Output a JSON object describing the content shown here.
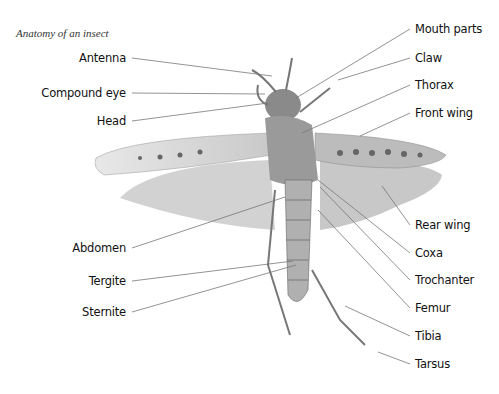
{
  "title": "Anatomy of an insect",
  "labels_left": [
    {
      "text": "Antenna",
      "x2": 128,
      "y": 58
    },
    {
      "text": "Compound eye",
      "x2": 128,
      "y": 93
    },
    {
      "text": "Head",
      "x2": 128,
      "y": 121
    },
    {
      "text": "Abdomen",
      "x2": 128,
      "y": 248
    },
    {
      "text": "Tergite",
      "x2": 128,
      "y": 281
    },
    {
      "text": "Sternite",
      "x2": 128,
      "y": 312
    }
  ],
  "labels_right": [
    {
      "text": "Mouth parts",
      "y": 29
    },
    {
      "text": "Claw",
      "y": 58
    },
    {
      "text": "Thorax",
      "y": 85
    },
    {
      "text": "Front wing",
      "y": 113
    },
    {
      "text": "Rear wing",
      "y": 225
    },
    {
      "text": "Coxa",
      "y": 253
    },
    {
      "text": "Trochanter",
      "y": 280
    },
    {
      "text": "Femur",
      "y": 308
    },
    {
      "text": "Tibia",
      "y": 336
    },
    {
      "text": "Tarsus",
      "y": 364
    }
  ],
  "colors": {
    "line": "#777777",
    "text": "#111111"
  }
}
